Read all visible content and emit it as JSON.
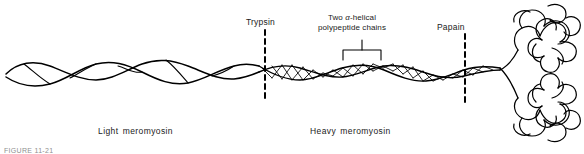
{
  "figure": {
    "caption_partial": "FIGURE 11-21"
  },
  "labels": {
    "trypsin": "Trypsin",
    "papain": "Papain",
    "chains_line1_pre": "Two ",
    "chains_alpha": "α",
    "chains_line1_post": "-helical",
    "chains_line2": "polypeptide chains",
    "light_meromyosin": "Light meromyosin",
    "heavy_meromyosin": "Heavy meromyosin"
  },
  "colors": {
    "ink": "#000000",
    "background": "#ffffff",
    "caption": "#8f8f8f"
  },
  "diagram": {
    "type": "schematic",
    "structures": [
      {
        "name": "coiled-coil-tail",
        "description": "loose two-stranded supercoil",
        "x_start": 6,
        "x_end": 250
      },
      {
        "name": "alpha-helical-rod",
        "description": "tight two-chain helix",
        "x_start": 250,
        "x_end": 500
      },
      {
        "name": "globular-head-upper",
        "cx": 540,
        "cy": 32
      },
      {
        "name": "globular-head-lower",
        "cx": 538,
        "cy": 110
      }
    ],
    "cleavage_sites": [
      {
        "enzyme": "Trypsin",
        "x": 265
      },
      {
        "enzyme": "Papain",
        "x": 465
      }
    ],
    "bracket": {
      "x_start": 343,
      "x_end": 381,
      "y": 52
    }
  }
}
